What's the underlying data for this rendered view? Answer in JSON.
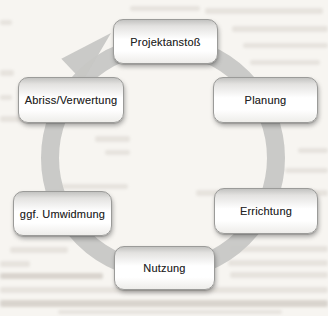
{
  "diagram": {
    "type": "cycle",
    "direction": "clockwise",
    "stages": [
      {
        "label": "Projektanstoß"
      },
      {
        "label": "Planung"
      },
      {
        "label": "Errichtung"
      },
      {
        "label": "Nutzung"
      },
      {
        "label": "ggf. Umwidmung"
      },
      {
        "label": "Abriss/Verwertung"
      }
    ],
    "colors": {
      "paper": "#f7f5f1",
      "ring": "#c7c7c5",
      "box_border": "#9b9b99",
      "box_top": "#c3c3c1",
      "box_mid": "#ffffff",
      "box_bottom": "#eeedea",
      "text": "#262626",
      "smudge": "#83776a"
    }
  }
}
